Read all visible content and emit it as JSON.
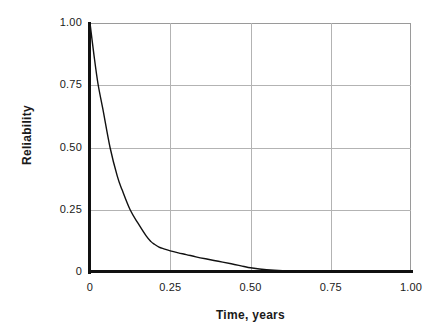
{
  "chart_data": {
    "type": "line",
    "title": "",
    "xlabel": "Time, years",
    "ylabel": "Reliability",
    "xlim": [
      0,
      1.0
    ],
    "ylim": [
      0,
      1.0
    ],
    "grid": true,
    "legend": "none",
    "x_ticks": [
      "0",
      "0.25",
      "0.50",
      "0.75",
      "1.00"
    ],
    "x_tick_values": [
      0,
      0.25,
      0.5,
      0.75,
      1.0
    ],
    "y_ticks": [
      "0",
      "0.25",
      "0.50",
      "0.75",
      "1.00"
    ],
    "y_tick_values": [
      0,
      0.25,
      0.5,
      0.75,
      1.0
    ],
    "series": [
      {
        "name": "Reliability",
        "color": "#111111",
        "x": [
          0.0,
          0.0125,
          0.025,
          0.04,
          0.0625,
          0.085,
          0.1,
          0.125,
          0.15,
          0.175,
          0.19,
          0.2,
          0.215,
          0.23,
          0.25,
          0.275,
          0.3,
          0.33,
          0.36,
          0.4,
          0.44,
          0.48,
          0.5,
          0.55,
          0.6,
          0.7,
          0.8,
          0.9,
          1.0
        ],
        "y": [
          1.0,
          0.87,
          0.755,
          0.655,
          0.5,
          0.385,
          0.33,
          0.25,
          0.195,
          0.145,
          0.122,
          0.112,
          0.1,
          0.093,
          0.085,
          0.077,
          0.07,
          0.061,
          0.053,
          0.043,
          0.033,
          0.022,
          0.017,
          0.009,
          0.005,
          0.002,
          0.001,
          0.0,
          0.0
        ]
      }
    ]
  },
  "axis_titles": {
    "x": "Time, years",
    "y": "Reliability"
  },
  "colors": {
    "curve": "#111111",
    "grid": "#b3b3b3",
    "axis": "#111111",
    "frame": "#9a9a9a",
    "background": "#ffffff"
  }
}
